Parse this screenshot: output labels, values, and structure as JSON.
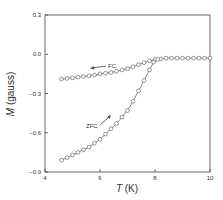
{
  "chart_data": {
    "type": "line",
    "title": "",
    "xlabel_var": "T",
    "xlabel_unit": " (K)",
    "ylabel_var": "M",
    "ylabel_unit": " (gauss)",
    "xlim": [
      4,
      10
    ],
    "ylim": [
      -0.9,
      0.3
    ],
    "xticks": [
      4,
      6,
      8,
      10
    ],
    "xtick_labels": [
      "4",
      "6",
      "8",
      "10"
    ],
    "yticks": [
      0.3,
      0.0,
      -0.3,
      -0.6,
      -0.9
    ],
    "ytick_labels": [
      "0.3",
      "0.0",
      "−0.3",
      "−0.6",
      "−0.9"
    ],
    "grid": false,
    "legend": "none",
    "colors": {
      "line": "#555555",
      "marker_fill": "#ffffff",
      "axis": "#444444"
    },
    "series": [
      {
        "name": "FC",
        "marker": "open-circle",
        "x": [
          4.6,
          4.8,
          5.0,
          5.2,
          5.4,
          5.6,
          5.8,
          6.0,
          6.2,
          6.4,
          6.6,
          6.8,
          7.0,
          7.2,
          7.4,
          7.6,
          7.8,
          8.0,
          8.2,
          8.4,
          8.6,
          8.8,
          9.0,
          9.2,
          9.4,
          9.6,
          9.8,
          10.0
        ],
        "y": [
          -0.19,
          -0.185,
          -0.18,
          -0.175,
          -0.17,
          -0.165,
          -0.16,
          -0.15,
          -0.145,
          -0.14,
          -0.13,
          -0.12,
          -0.11,
          -0.095,
          -0.08,
          -0.065,
          -0.05,
          -0.04,
          -0.035,
          -0.03,
          -0.03,
          -0.03,
          -0.03,
          -0.03,
          -0.03,
          -0.03,
          -0.03,
          -0.03
        ]
      },
      {
        "name": "ZFC",
        "marker": "open-circle",
        "x": [
          4.6,
          4.8,
          5.0,
          5.2,
          5.4,
          5.6,
          5.8,
          6.0,
          6.2,
          6.4,
          6.6,
          6.8,
          7.0,
          7.2,
          7.4,
          7.6,
          7.8,
          7.95,
          8.1
        ],
        "y": [
          -0.81,
          -0.79,
          -0.77,
          -0.75,
          -0.73,
          -0.71,
          -0.68,
          -0.65,
          -0.61,
          -0.57,
          -0.53,
          -0.48,
          -0.43,
          -0.36,
          -0.28,
          -0.2,
          -0.12,
          -0.06,
          -0.04
        ]
      }
    ],
    "annotations": [
      {
        "text": "FC",
        "arrow": "left",
        "series": "FC",
        "at_x": 6.6,
        "at_y": -0.1
      },
      {
        "text": "ZFC",
        "arrow": "up-right",
        "series": "ZFC",
        "at_x": 5.7,
        "at_y": -0.56
      }
    ]
  }
}
